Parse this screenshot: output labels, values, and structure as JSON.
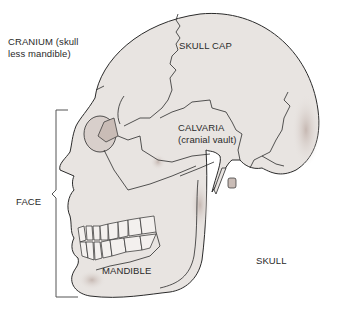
{
  "diagram": {
    "type": "anatomical-illustration",
    "colors": {
      "bone": "#e8e4e1",
      "outline": "#2b2b2b",
      "shadow": "#c9bcb6",
      "text": "#2a2a2a",
      "background": "#ffffff"
    },
    "labels": {
      "cranium_line1": "CRANIUM (skull",
      "cranium_line2": "less mandible)",
      "skull_cap": "SKULL CAP",
      "calvaria_line1": "CALVARIA",
      "calvaria_line2": "(cranial vault)",
      "face": "FACE",
      "mandible": "MANDIBLE",
      "skull": "SKULL"
    }
  }
}
